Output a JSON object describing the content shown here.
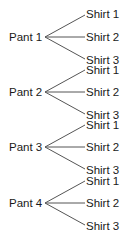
{
  "diagram": {
    "type": "tree-diagram",
    "groups": [
      {
        "label": "Pant 1",
        "branches": [
          "Shirt 1",
          "Shirt 2",
          "Shirt 3"
        ]
      },
      {
        "label": "Pant 2",
        "branches": [
          "Shirt 1",
          "Shirt 2",
          "Shirt 3"
        ]
      },
      {
        "label": "Pant 3",
        "branches": [
          "Shirt 1",
          "Shirt 2",
          "Shirt 3"
        ]
      },
      {
        "label": "Pant 4",
        "branches": [
          "Shirt 1",
          "Shirt 2",
          "Shirt 3"
        ]
      }
    ],
    "line_color": "#555555",
    "text_color": "#1a1a1a"
  }
}
